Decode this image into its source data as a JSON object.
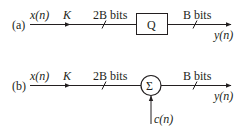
{
  "diagram": {
    "colors": {
      "stroke": "#231f20",
      "background": "#ffffff"
    },
    "a": {
      "label": "(a)",
      "input": "x(n)",
      "rate": "K",
      "input_bits": "2B bits",
      "block": "Q",
      "output_bits": "B bits",
      "output": "y(n)"
    },
    "b": {
      "label": "(b)",
      "input": "x(n)",
      "rate": "K",
      "input_bits": "2B bits",
      "block": "Σ",
      "side_input": "c(n)",
      "output_bits": "B bits",
      "output": "y(n)"
    }
  }
}
